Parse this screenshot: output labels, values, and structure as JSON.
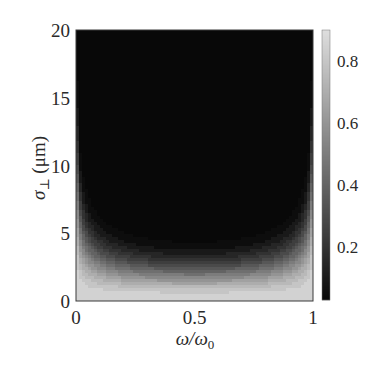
{
  "chart_data": {
    "type": "heatmap",
    "subtype": "filled-contour",
    "title": "",
    "xlabel": "ω/ω₀",
    "ylabel": "σ⊥ (μm)",
    "xlim": [
      0,
      1
    ],
    "ylim": [
      0,
      20
    ],
    "x_ticks": [
      0,
      0.5,
      1
    ],
    "x_tick_labels": [
      "0",
      "0.5",
      "1"
    ],
    "y_ticks": [
      0,
      5,
      10,
      15,
      20
    ],
    "y_tick_labels": [
      "0",
      "5",
      "10",
      "15",
      "20"
    ],
    "grid": false,
    "colormap": "gray",
    "colorbar": {
      "position": "right",
      "range": [
        0.03,
        0.9
      ],
      "ticks": [
        0.2,
        0.4,
        0.6,
        0.8
      ],
      "tick_labels": [
        "0.2",
        "0.4",
        "0.6",
        "0.8"
      ]
    },
    "contour_levels": [
      0.05,
      0.1,
      0.15,
      0.2,
      0.25,
      0.3,
      0.35,
      0.4,
      0.45,
      0.5,
      0.55,
      0.6,
      0.65,
      0.7,
      0.75,
      0.8,
      0.85
    ],
    "model": {
      "description": "value ≈ 0.9·exp(-σ²/(2·w(ω)²)), w(ω) = 1.8·(4ω(1-ω))^(-0.36) μm",
      "amplitude": 0.9,
      "w_center_um": 1.8,
      "edge_exponent": 0.36
    },
    "dark_region_boundary_sigma_um": {
      "omega": [
        0.02,
        0.1,
        0.25,
        0.5,
        0.75,
        0.9,
        0.98
      ],
      "sigma": [
        9.5,
        6.3,
        4.8,
        4.1,
        4.8,
        6.3,
        9.5
      ]
    },
    "sample_profiles": [
      {
        "omega": 0.5,
        "sigma": [
          0,
          1,
          2,
          3,
          4,
          5,
          10,
          20
        ],
        "value": [
          0.9,
          0.77,
          0.49,
          0.23,
          0.08,
          0.02,
          0.0,
          0.0
        ]
      },
      {
        "omega": 0.05,
        "sigma": [
          0,
          2,
          4,
          6,
          8,
          10,
          20
        ],
        "value": [
          0.9,
          0.81,
          0.59,
          0.34,
          0.15,
          0.06,
          0.0
        ]
      }
    ]
  },
  "axes": {
    "xlabel_main": "ω/ω",
    "xlabel_sub": "0",
    "ylabel_main": "σ",
    "ylabel_sub": "⊥",
    "ylabel_unit": " (μm)"
  }
}
